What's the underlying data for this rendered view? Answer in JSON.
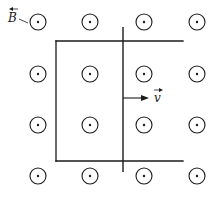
{
  "diagram": {
    "field": {
      "label": "B",
      "direction": "out-of-page",
      "symbol": "dot-in-circle",
      "grid_rows": 4,
      "grid_cols": 4
    },
    "velocity": {
      "label": "v",
      "direction": "right"
    }
  }
}
